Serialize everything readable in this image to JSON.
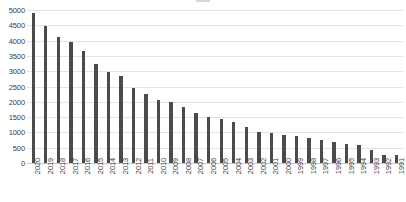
{
  "chart_data": {
    "type": "bar",
    "title": "",
    "xlabel": "",
    "ylabel": "",
    "ylim": [
      0,
      5000
    ],
    "grid": true,
    "legend": "none",
    "orientation": "vertical",
    "bar_color": "#4b4b4b",
    "gridline_color": "#e3e3e3",
    "y_ticks": [
      0,
      500,
      1000,
      1500,
      2000,
      2500,
      3000,
      3500,
      4000,
      4500,
      5000
    ],
    "y_tick_labels": [
      "0",
      "500",
      "1000",
      "1500",
      "2000",
      "2500",
      "3000",
      "3500",
      "4000",
      "4500",
      "5000"
    ],
    "categories": [
      "2020",
      "2019",
      "2018",
      "2017",
      "2016",
      "2015",
      "2014",
      "2013",
      "2012",
      "2011",
      "2010",
      "2009",
      "2008",
      "2007",
      "2006",
      "2005",
      "2004",
      "2003",
      "2002",
      "2001",
      "2000",
      "1999",
      "1998",
      "1997",
      "1996",
      "1995",
      "1994",
      "1993",
      "1992",
      "1991"
    ],
    "values": [
      4900,
      4480,
      4130,
      3960,
      3650,
      3230,
      2970,
      2850,
      2450,
      2260,
      2070,
      1980,
      1840,
      1620,
      1520,
      1450,
      1330,
      1180,
      1010,
      980,
      930,
      880,
      830,
      760,
      700,
      620,
      600,
      420,
      260,
      250
    ]
  },
  "axes": {
    "y_axis_name": "y-axis",
    "x_axis_name": "x-axis"
  }
}
